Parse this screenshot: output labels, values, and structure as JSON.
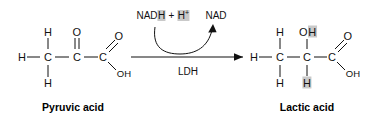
{
  "figure": {
    "background_color": "#ffffff",
    "ink_color": "#111111",
    "highlight_color": "#c9c9c9"
  },
  "reactant": {
    "caption": "Pyruvic acid",
    "atoms": {
      "h_left": "H",
      "c1": "C",
      "h_top": "H",
      "h_bottom": "H",
      "c2": "C",
      "o_double": "O",
      "c3": "C",
      "o_carbonyl": "O",
      "oh": "OH"
    }
  },
  "product": {
    "caption": "Lactic acid",
    "atoms": {
      "h_left": "H",
      "c1": "C",
      "h_top": "H",
      "h_bottom": "H",
      "c2": "C",
      "oh_top_o": "O",
      "oh_top_h": "H",
      "h_bottom_hl": "H",
      "c3": "C",
      "o_carbonyl": "O",
      "oh": "OH"
    }
  },
  "reaction": {
    "enzyme_label": "LDH",
    "cofactor_in": "NADH + H",
    "cofactor_in_charge": "+",
    "cofactor_out": "NAD"
  }
}
